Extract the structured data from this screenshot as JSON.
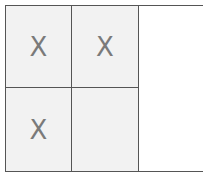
{
  "board": {
    "cells": [
      {
        "row": 0,
        "col": 0,
        "mark": "X"
      },
      {
        "row": 0,
        "col": 1,
        "mark": "X"
      },
      {
        "row": 1,
        "col": 0,
        "mark": "X"
      },
      {
        "row": 1,
        "col": 1,
        "mark": ""
      }
    ]
  },
  "colors": {
    "cell_bg": "#f2f2f2",
    "grid_line": "#555555",
    "mark": "#7a7a7a",
    "empty_column": "#ffffff"
  }
}
